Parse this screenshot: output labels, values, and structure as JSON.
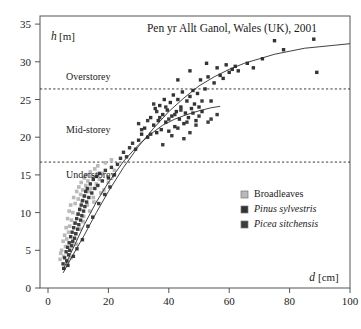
{
  "chart_data": {
    "type": "scatter",
    "title": "Pen yr Allt Ganol, Wales (UK), 2001",
    "xlabel_symbol": "d",
    "xlabel_unit": "[cm]",
    "ylabel_symbol": "h",
    "ylabel_unit": "[m]",
    "xlim": [
      -2,
      105
    ],
    "ylim": [
      0,
      36
    ],
    "xticks": [
      0,
      20,
      40,
      60,
      80,
      100
    ],
    "yticks": [
      0,
      5,
      10,
      15,
      20,
      25,
      30,
      35
    ],
    "grid": false,
    "legend_position": "bottom-right",
    "annotations": [
      {
        "label": "Overstorey",
        "y": 26.4,
        "dashed_line": true,
        "x_text": 6
      },
      {
        "label": "Mid-storey",
        "y": 16.7,
        "dashed_line": true,
        "x_text": 6
      },
      {
        "label": "Understorey",
        "y": null,
        "dashed_line": false,
        "x_text": 6
      }
    ],
    "storey_boundaries": [
      26.4,
      16.7
    ],
    "series": [
      {
        "name": "Broadleaves",
        "marker": "square",
        "color": "#b9b9b9",
        "points": [
          [
            4.5,
            5.0
          ],
          [
            5.0,
            6.2
          ],
          [
            5.2,
            4.2
          ],
          [
            5.5,
            7.0
          ],
          [
            5.8,
            5.5
          ],
          [
            6.0,
            8.0
          ],
          [
            6.2,
            6.5
          ],
          [
            6.5,
            9.2
          ],
          [
            6.8,
            7.4
          ],
          [
            7.0,
            10.2
          ],
          [
            7.2,
            8.2
          ],
          [
            7.5,
            11.0
          ],
          [
            7.8,
            9.0
          ],
          [
            8.0,
            6.0
          ],
          [
            8.2,
            10.0
          ],
          [
            8.5,
            12.0
          ],
          [
            8.8,
            8.6
          ],
          [
            9.0,
            11.2
          ],
          [
            9.2,
            7.2
          ],
          [
            9.5,
            12.8
          ],
          [
            9.8,
            9.8
          ],
          [
            10.0,
            11.8
          ],
          [
            10.2,
            13.4
          ],
          [
            10.5,
            10.5
          ],
          [
            10.8,
            12.4
          ],
          [
            11.0,
            14.0
          ],
          [
            11.2,
            11.5
          ],
          [
            11.5,
            13.0
          ],
          [
            11.8,
            9.5
          ],
          [
            12.0,
            14.6
          ],
          [
            12.2,
            12.2
          ],
          [
            12.5,
            13.6
          ],
          [
            12.8,
            15.0
          ],
          [
            13.0,
            11.0
          ],
          [
            13.2,
            14.2
          ],
          [
            13.5,
            12.8
          ],
          [
            14.0,
            15.4
          ],
          [
            14.2,
            13.2
          ],
          [
            14.5,
            14.8
          ],
          [
            15.0,
            12.0
          ],
          [
            15.5,
            15.8
          ],
          [
            16.0,
            13.8
          ],
          [
            16.5,
            16.2
          ],
          [
            17.0,
            14.4
          ],
          [
            17.5,
            12.6
          ],
          [
            18.0,
            15.2
          ],
          [
            19.0,
            16.6
          ],
          [
            20.0,
            14.0
          ],
          [
            21.0,
            17.0
          ],
          [
            22.0,
            15.6
          ],
          [
            4.0,
            3.8
          ],
          [
            4.2,
            4.6
          ],
          [
            6.4,
            3.5
          ],
          [
            7.6,
            4.0
          ],
          [
            9.4,
            5.8
          ],
          [
            10.6,
            7.8
          ],
          [
            11.6,
            8.8
          ],
          [
            13.8,
            10.2
          ],
          [
            15.2,
            11.4
          ],
          [
            18.5,
            13.0
          ]
        ]
      },
      {
        "name": "Pinus sylvestris",
        "marker": "square",
        "color": "#333333",
        "points": [
          [
            30.0,
            19.6
          ],
          [
            31.0,
            20.4
          ],
          [
            32.0,
            21.2
          ],
          [
            33.0,
            20.0
          ],
          [
            34.0,
            22.6
          ],
          [
            35.0,
            21.6
          ],
          [
            35.5,
            23.8
          ],
          [
            36.0,
            20.6
          ],
          [
            36.5,
            22.2
          ],
          [
            37.0,
            24.2
          ],
          [
            37.5,
            21.0
          ],
          [
            38.0,
            23.0
          ],
          [
            38.5,
            25.0
          ],
          [
            39.0,
            22.0
          ],
          [
            39.5,
            23.6
          ],
          [
            40.0,
            20.8
          ],
          [
            40.5,
            24.6
          ],
          [
            41.0,
            22.8
          ],
          [
            41.5,
            25.6
          ],
          [
            42.0,
            21.4
          ],
          [
            42.5,
            23.4
          ],
          [
            43.0,
            25.0
          ],
          [
            43.5,
            22.4
          ],
          [
            44.0,
            24.0
          ],
          [
            44.5,
            26.0
          ],
          [
            45.0,
            21.8
          ],
          [
            45.5,
            23.2
          ],
          [
            46.0,
            24.8
          ],
          [
            46.5,
            22.6
          ],
          [
            47.0,
            25.4
          ],
          [
            47.5,
            23.8
          ],
          [
            48.0,
            26.2
          ],
          [
            48.5,
            24.4
          ],
          [
            49.0,
            22.2
          ],
          [
            49.5,
            25.8
          ],
          [
            50.0,
            24.0
          ],
          [
            50.5,
            27.6
          ],
          [
            51.0,
            23.4
          ],
          [
            52.0,
            26.4
          ],
          [
            53.0,
            28.0
          ],
          [
            54.0,
            24.8
          ],
          [
            55.0,
            27.2
          ],
          [
            56.0,
            29.2
          ],
          [
            57.0,
            28.2
          ],
          [
            58.0,
            27.8
          ],
          [
            59.0,
            29.6
          ],
          [
            60.0,
            28.6
          ],
          [
            61.0,
            29.0
          ],
          [
            62.0,
            29.4
          ],
          [
            63.0,
            28.8
          ],
          [
            66.0,
            29.8
          ],
          [
            68.0,
            29.2
          ],
          [
            71.0,
            30.4
          ],
          [
            75.0,
            32.8
          ],
          [
            78.0,
            31.6
          ],
          [
            88.0,
            33.0
          ],
          [
            89.0,
            28.6
          ],
          [
            52.5,
            29.8
          ],
          [
            47.0,
            28.8
          ],
          [
            43.0,
            27.6
          ]
        ]
      },
      {
        "name": "Picea sitchensis",
        "marker": "square",
        "color": "#3d3d3d",
        "points": [
          [
            5.0,
            3.2
          ],
          [
            5.5,
            4.0
          ],
          [
            6.0,
            4.8
          ],
          [
            6.2,
            3.6
          ],
          [
            6.5,
            5.4
          ],
          [
            6.8,
            4.4
          ],
          [
            7.0,
            6.0
          ],
          [
            7.2,
            5.0
          ],
          [
            7.5,
            6.8
          ],
          [
            7.8,
            5.6
          ],
          [
            8.0,
            7.4
          ],
          [
            8.2,
            6.2
          ],
          [
            8.5,
            8.0
          ],
          [
            8.8,
            6.6
          ],
          [
            9.0,
            8.6
          ],
          [
            9.2,
            7.2
          ],
          [
            9.5,
            9.2
          ],
          [
            9.8,
            7.8
          ],
          [
            10.0,
            9.8
          ],
          [
            10.2,
            8.4
          ],
          [
            10.5,
            10.4
          ],
          [
            10.8,
            9.0
          ],
          [
            11.0,
            11.0
          ],
          [
            11.2,
            9.6
          ],
          [
            11.5,
            11.6
          ],
          [
            11.8,
            10.2
          ],
          [
            12.0,
            12.2
          ],
          [
            12.2,
            10.8
          ],
          [
            12.5,
            12.8
          ],
          [
            12.8,
            11.4
          ],
          [
            13.0,
            13.2
          ],
          [
            13.5,
            12.0
          ],
          [
            14.0,
            13.8
          ],
          [
            14.5,
            12.6
          ],
          [
            15.0,
            14.4
          ],
          [
            15.5,
            13.2
          ],
          [
            16.0,
            14.8
          ],
          [
            16.5,
            13.6
          ],
          [
            17.0,
            15.2
          ],
          [
            18.0,
            14.2
          ],
          [
            19.0,
            15.6
          ],
          [
            20.0,
            14.6
          ],
          [
            21.0,
            16.0
          ],
          [
            22.0,
            15.0
          ],
          [
            23.0,
            16.4
          ],
          [
            24.0,
            17.2
          ],
          [
            25.0,
            18.0
          ],
          [
            26.0,
            17.4
          ],
          [
            27.0,
            18.6
          ],
          [
            28.0,
            19.2
          ],
          [
            29.0,
            18.4
          ],
          [
            30.0,
            21.8
          ],
          [
            31.0,
            21.0
          ],
          [
            33.0,
            22.2
          ],
          [
            34.0,
            20.4
          ],
          [
            35.0,
            24.4
          ],
          [
            36.0,
            23.4
          ],
          [
            37.0,
            22.6
          ],
          [
            38.0,
            19.0
          ],
          [
            39.0,
            24.0
          ],
          [
            40.0,
            22.4
          ],
          [
            41.0,
            20.2
          ],
          [
            42.0,
            23.0
          ],
          [
            43.0,
            21.2
          ],
          [
            44.0,
            23.6
          ],
          [
            45.0,
            19.8
          ],
          [
            46.0,
            22.0
          ],
          [
            47.0,
            20.6
          ],
          [
            48.0,
            23.2
          ],
          [
            49.0,
            21.6
          ],
          [
            50.0,
            22.8
          ],
          [
            51.0,
            24.8
          ],
          [
            53.0,
            22.0
          ],
          [
            54.0,
            22.4
          ],
          [
            56.0,
            23.0
          ],
          [
            5.2,
            2.6
          ],
          [
            6.6,
            3.0
          ],
          [
            8.4,
            4.2
          ],
          [
            9.6,
            5.2
          ],
          [
            11.4,
            6.4
          ],
          [
            13.2,
            8.2
          ],
          [
            14.8,
            9.4
          ],
          [
            16.8,
            11.2
          ],
          [
            18.8,
            12.4
          ],
          [
            20.5,
            13.4
          ]
        ]
      }
    ],
    "fitted_curves": [
      {
        "name": "pinus-growth-curve",
        "description": "upper asymptotic height-diameter curve",
        "points": [
          [
            5,
            2.0
          ],
          [
            8,
            4.2
          ],
          [
            12,
            7.0
          ],
          [
            16,
            10.0
          ],
          [
            20,
            12.8
          ],
          [
            25,
            16.0
          ],
          [
            30,
            18.8
          ],
          [
            35,
            21.2
          ],
          [
            40,
            23.4
          ],
          [
            45,
            25.2
          ],
          [
            50,
            26.8
          ],
          [
            55,
            28.0
          ],
          [
            60,
            29.0
          ],
          [
            65,
            29.8
          ],
          [
            70,
            30.4
          ],
          [
            75,
            31.0
          ],
          [
            80,
            31.4
          ],
          [
            85,
            31.8
          ],
          [
            90,
            32.0
          ],
          [
            95,
            32.2
          ],
          [
            100,
            32.4
          ]
        ]
      },
      {
        "name": "picea-growth-curve",
        "description": "lower asymptotic height-diameter curve flattening near 24 m",
        "points": [
          [
            5,
            2.4
          ],
          [
            8,
            5.0
          ],
          [
            12,
            8.4
          ],
          [
            16,
            11.4
          ],
          [
            20,
            14.0
          ],
          [
            25,
            16.8
          ],
          [
            30,
            19.0
          ],
          [
            34,
            20.4
          ],
          [
            38,
            21.6
          ],
          [
            42,
            22.4
          ],
          [
            46,
            23.0
          ],
          [
            50,
            23.5
          ],
          [
            54,
            23.9
          ],
          [
            57,
            24.1
          ]
        ]
      }
    ]
  }
}
